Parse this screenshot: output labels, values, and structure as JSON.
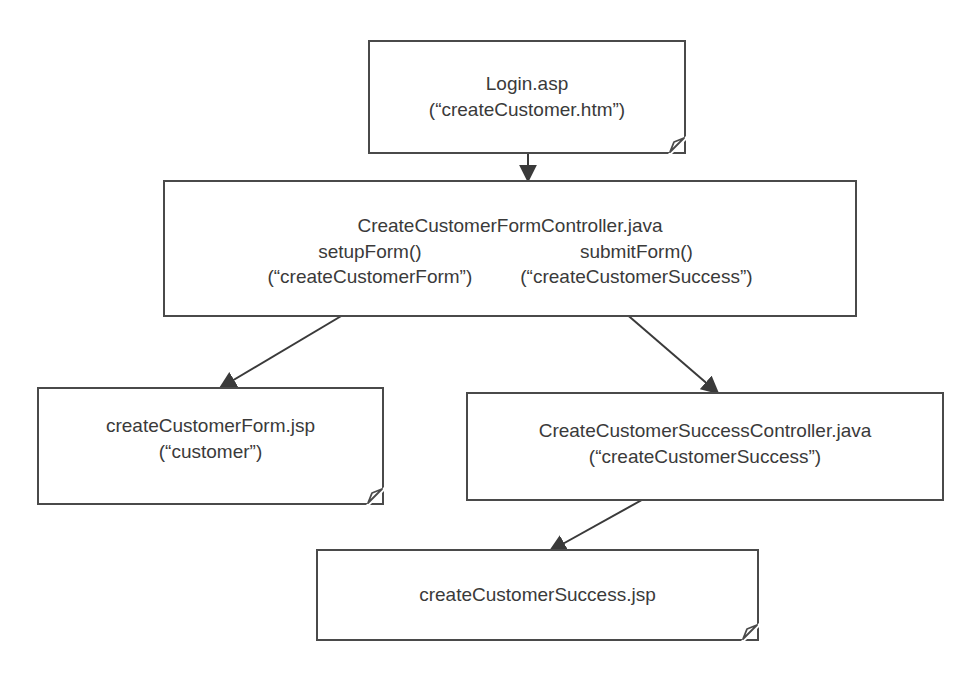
{
  "diagram": {
    "nodes": {
      "login": {
        "type": "document",
        "lines": [
          "Login.asp",
          "(“createCustomer.htm”)"
        ]
      },
      "form_controller": {
        "type": "process",
        "title": "CreateCustomerFormController.java",
        "left": {
          "method": "setupForm()",
          "view": "(“createCustomerForm”)"
        },
        "right": {
          "method": "submitForm()",
          "view": "(“createCustomerSuccess”)"
        }
      },
      "form_jsp": {
        "type": "document",
        "lines": [
          "createCustomerForm.jsp",
          "(“customer”)"
        ]
      },
      "success_controller": {
        "type": "process",
        "lines": [
          "CreateCustomerSuccessController.java",
          "(“createCustomerSuccess”)"
        ]
      },
      "success_jsp": {
        "type": "document",
        "lines": [
          "createCustomerSuccess.jsp"
        ]
      }
    },
    "edges": [
      {
        "from": "login",
        "to": "form_controller"
      },
      {
        "from": "form_controller.setupForm",
        "to": "form_jsp"
      },
      {
        "from": "form_controller.submitForm",
        "to": "success_controller"
      },
      {
        "from": "success_controller",
        "to": "success_jsp"
      }
    ],
    "colors": {
      "stroke": "#4a4a4a",
      "text": "#3a3a3a",
      "background": "#ffffff"
    }
  }
}
